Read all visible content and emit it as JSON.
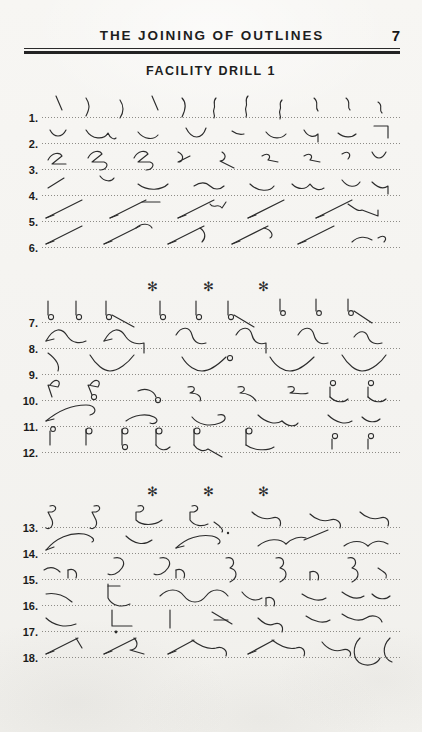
{
  "page": {
    "background_color": "#f5f4f1",
    "ink_color": "#2c2c2c",
    "width": 422,
    "height": 732
  },
  "header": {
    "title": "THE JOINING OF OUTLINES",
    "page_number": "7",
    "rule_color": "#232323"
  },
  "subtitle": "FACILITY DRILL 1",
  "separators": {
    "glyph": "✻",
    "positions_x": [
      152,
      208,
      263
    ],
    "rows_y": [
      284,
      489
    ]
  },
  "blocks": [
    {
      "name": "block-1",
      "top": 92,
      "lines": [
        {
          "number": "1."
        },
        {
          "number": "2."
        },
        {
          "number": "3."
        },
        {
          "number": "4."
        },
        {
          "number": "5."
        },
        {
          "number": "6."
        }
      ]
    },
    {
      "name": "block-2",
      "top": 297,
      "lines": [
        {
          "number": "7."
        },
        {
          "number": "8."
        },
        {
          "number": "9."
        },
        {
          "number": "10."
        },
        {
          "number": "11."
        },
        {
          "number": "12."
        }
      ]
    },
    {
      "name": "block-3",
      "top": 502,
      "lines": [
        {
          "number": "13."
        },
        {
          "number": "14."
        },
        {
          "number": "15."
        },
        {
          "number": "16."
        },
        {
          "number": "17."
        },
        {
          "number": "18."
        }
      ]
    }
  ]
}
